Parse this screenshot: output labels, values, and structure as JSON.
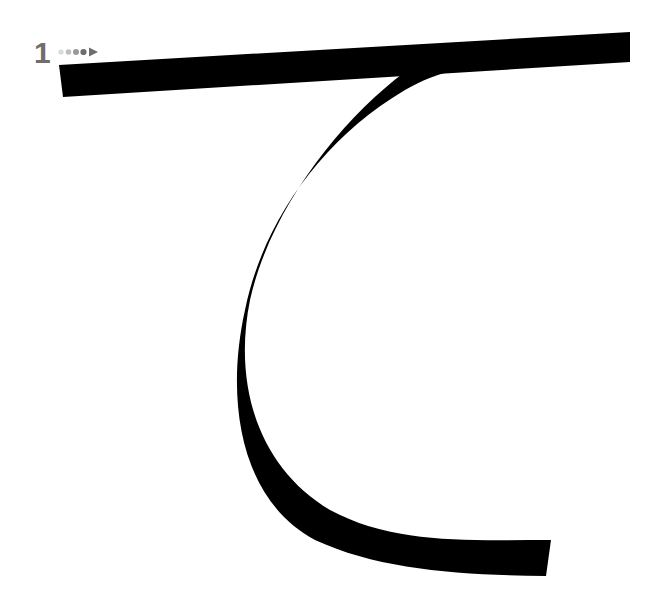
{
  "diagram": {
    "character": "て",
    "type": "stroke-order",
    "stroke_count": 1,
    "stroke_number_label": "1",
    "stroke_color": "#000000",
    "label_color": "#6e6e6e",
    "direction_indicator": {
      "dots": [
        "#d9d9d9",
        "#bfbfbf",
        "#999999",
        "#6e6e6e"
      ],
      "arrow_color": "#6e6e6e"
    },
    "background": "#ffffff"
  }
}
